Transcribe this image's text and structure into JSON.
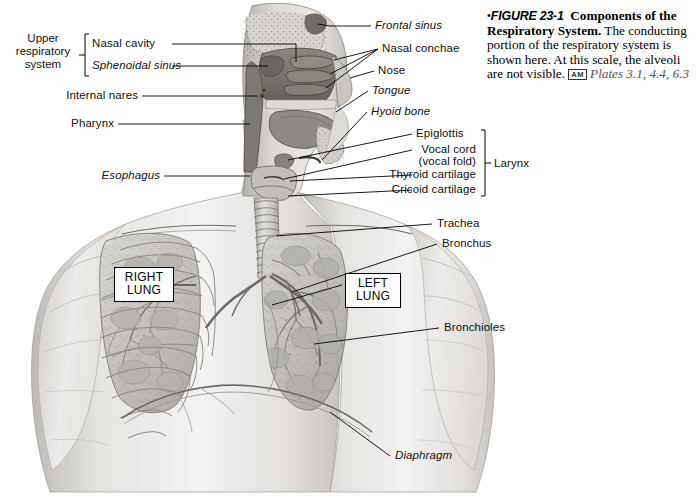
{
  "figure": {
    "bullet": "•",
    "number": "FIGURE 23-1",
    "title": "Components of the Respiratory System.",
    "body": "The conducting portion of the respiratory system is shown here. At this scale, the alveoli are not visible.",
    "badge": "AM",
    "plates": "Plates 3.1, 4.4, 6.3"
  },
  "groups": {
    "upper_respiratory_system": "Upper\nrespiratory\nsystem",
    "upper_respiratory_system_l1": "Upper",
    "upper_respiratory_system_l2": "respiratory",
    "upper_respiratory_system_l3": "system",
    "larynx": "Larynx"
  },
  "labels_left": [
    {
      "id": "nasal-cavity",
      "text": "Nasal cavity",
      "italic": false
    },
    {
      "id": "sphenoidal-sinus",
      "text": "Sphenoidal sinus",
      "italic": true
    },
    {
      "id": "internal-nares",
      "text": "Internal nares",
      "italic": false
    },
    {
      "id": "pharynx",
      "text": "Pharynx",
      "italic": false
    },
    {
      "id": "esophagus",
      "text": "Esophagus",
      "italic": true
    }
  ],
  "labels_right": [
    {
      "id": "frontal-sinus",
      "text": "Frontal sinus",
      "italic": true
    },
    {
      "id": "nasal-conchae",
      "text": "Nasal conchae",
      "italic": false
    },
    {
      "id": "nose",
      "text": "Nose",
      "italic": false
    },
    {
      "id": "tongue",
      "text": "Tongue",
      "italic": true
    },
    {
      "id": "hyoid-bone",
      "text": "Hyoid bone",
      "italic": true
    },
    {
      "id": "epiglottis",
      "text": "Epiglottis",
      "italic": false
    },
    {
      "id": "vocal-cord-1",
      "text": "Vocal cord",
      "italic": false
    },
    {
      "id": "vocal-cord-2",
      "text": "(vocal fold)",
      "italic": false
    },
    {
      "id": "thyroid-cartilage",
      "text": "Thyroid cartilage",
      "italic": false
    },
    {
      "id": "cricoid-cartilage",
      "text": "Cricoid cartilage",
      "italic": false
    },
    {
      "id": "trachea",
      "text": "Trachea",
      "italic": false
    },
    {
      "id": "bronchus",
      "text": "Bronchus",
      "italic": false
    },
    {
      "id": "bronchioles",
      "text": "Bronchioles",
      "italic": false
    },
    {
      "id": "diaphragm",
      "text": "Diaphragm",
      "italic": true
    }
  ],
  "boxed_labels": {
    "right_lung_line1": "RIGHT",
    "right_lung_line2": "LUNG",
    "left_lung_line1": "LEFT",
    "left_lung_line2": "LUNG"
  },
  "colors": {
    "page_background": "#ffffff",
    "leader_line": "#000000",
    "text": "#111111",
    "skin_light": "#f0efee",
    "skin_mid": "#d9d7d4",
    "skin_shadow": "#b9b6b2",
    "lung_fill": "#c8c6c2",
    "lung_dark": "#9e9b97",
    "cavity_dark": "#6e6a66",
    "cavity_mid": "#8d8884",
    "outline": "#55514e"
  }
}
